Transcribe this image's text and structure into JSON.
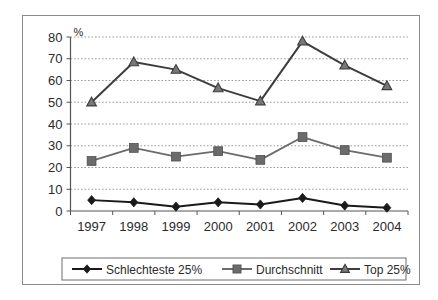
{
  "chart_data": {
    "type": "line",
    "title": "",
    "xlabel": "",
    "ylabel": "%",
    "unit_label": "%",
    "categories": [
      "1997",
      "1998",
      "1999",
      "2000",
      "2001",
      "2002",
      "2003",
      "2004"
    ],
    "ylim": [
      0,
      80
    ],
    "ytick_step": 10,
    "yticks": [
      "0",
      "10",
      "20",
      "30",
      "40",
      "50",
      "60",
      "70",
      "80"
    ],
    "grid": "horizontal-dotted",
    "legend_position": "bottom",
    "series": [
      {
        "name": "Schlechteste 25%",
        "marker": "diamond",
        "color": "#1a1a1a",
        "values": [
          5,
          4,
          2,
          4,
          3,
          6,
          2.5,
          1.5
        ]
      },
      {
        "name": "Durchschnitt",
        "marker": "square",
        "color": "#6b6b6b",
        "values": [
          23,
          29,
          25,
          27.5,
          23.5,
          34,
          28,
          24.5
        ]
      },
      {
        "name": "Top 25%",
        "marker": "triangle",
        "color": "#3d3d3d",
        "values": [
          50,
          68.5,
          65,
          56.5,
          50.5,
          78,
          67,
          57.5
        ]
      }
    ]
  },
  "colors": {
    "frame": "#8a8a8a",
    "axis": "#555555",
    "gridline": "#9a9a9a",
    "background": "#ffffff",
    "text": "#2b2b2b",
    "series_worst": "#1a1a1a",
    "series_average": "#6b6b6b",
    "series_top": "#3d3d3d"
  }
}
